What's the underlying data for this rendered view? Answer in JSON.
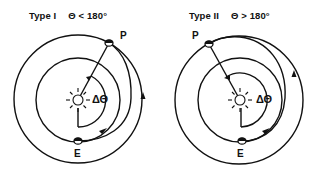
{
  "diagrams": [
    {
      "title_type": "Type I",
      "title_condition": "Θ < 180°",
      "planet_label": "P",
      "earth_label": "E",
      "angle_label": "ΔΘ"
    },
    {
      "title_type": "Type II",
      "title_condition": "Θ > 180°",
      "planet_label": "P",
      "earth_label": "E",
      "angle_label": "ΔΘ"
    }
  ],
  "colors": {
    "ink": "#111111",
    "background": "#ffffff"
  }
}
